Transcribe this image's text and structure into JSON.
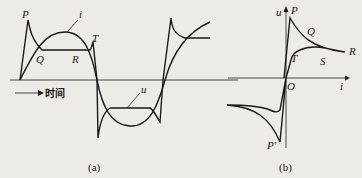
{
  "panel_a": {
    "caption": "(a)",
    "time_label": "时间",
    "labels": {
      "P": "P",
      "i": "i",
      "T": "T",
      "Q": "Q",
      "R": "R",
      "u": "u"
    }
  },
  "panel_b": {
    "caption": "(b)",
    "labels": {
      "u": "u",
      "P": "P",
      "Q": "Q",
      "R": "R",
      "T": "T",
      "S": "S",
      "O": "O",
      "i": "i",
      "P_prime": "P'"
    }
  },
  "colors": {
    "ink": "#1a1a1a",
    "paper": "#ecebe6"
  }
}
